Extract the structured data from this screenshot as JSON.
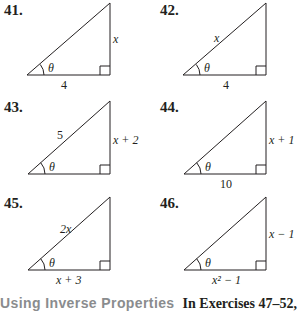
{
  "exercises": [
    {
      "number": "41.",
      "hyp": "",
      "opp": "x",
      "adj": "4",
      "angle": "θ"
    },
    {
      "number": "42.",
      "hyp": "x",
      "opp": "",
      "adj": "4",
      "angle": "θ"
    },
    {
      "number": "43.",
      "hyp": "5",
      "opp": "x + 2",
      "adj": "",
      "angle": "θ"
    },
    {
      "number": "44.",
      "hyp": "",
      "opp": "x + 1",
      "adj": "10",
      "angle": "θ"
    },
    {
      "number": "45.",
      "hyp": "2x",
      "opp": "",
      "adj": "x + 3",
      "angle": "θ"
    },
    {
      "number": "46.",
      "hyp": "",
      "opp": "x − 1",
      "adj": "x² − 1",
      "angle": "θ"
    }
  ],
  "footer": {
    "section_heading": "Using Inverse Properties",
    "instruction": "In Exercises 47–52,"
  },
  "colors": {
    "text": "#231f20",
    "heading_gray": "#8a8c8e"
  }
}
